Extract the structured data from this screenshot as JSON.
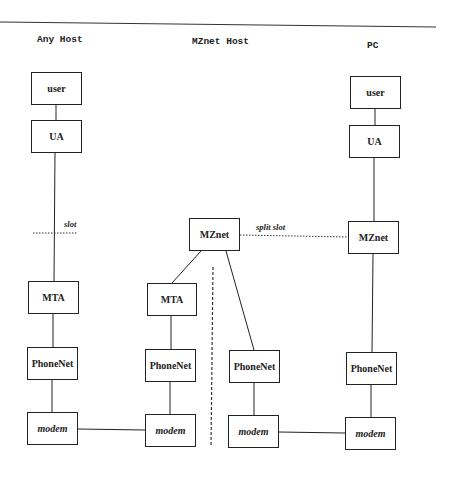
{
  "diagram": {
    "columns": [
      {
        "id": "any-host",
        "title": "Any Host"
      },
      {
        "id": "mznet-host",
        "title": "MZnet Host"
      },
      {
        "id": "pc",
        "title": "PC"
      }
    ],
    "nodes": {
      "any_user": "user",
      "any_ua": "UA",
      "any_mta": "MTA",
      "any_phonenet": "PhoneNet",
      "any_modem": "modem",
      "mz_mznet": "MZnet",
      "mz_mta": "MTA",
      "mz_phonenet_left": "PhoneNet",
      "mz_modem_left": "modem",
      "mz_phonenet_right": "PhoneNet",
      "mz_modem_right": "modem",
      "pc_user": "user",
      "pc_ua": "UA",
      "pc_mznet": "MZnet",
      "pc_phonenet": "PhoneNet",
      "pc_modem": "modem"
    },
    "labels": {
      "slot": "slot",
      "split_slot": "split slot"
    },
    "edges": [
      [
        "any_user",
        "any_ua"
      ],
      [
        "any_ua",
        "any_mta"
      ],
      [
        "any_mta",
        "any_phonenet"
      ],
      [
        "any_phonenet",
        "any_modem"
      ],
      [
        "any_modem",
        "mz_modem_left"
      ],
      [
        "mz_mznet",
        "mz_mta"
      ],
      [
        "mz_mznet",
        "mz_phonenet_right"
      ],
      [
        "mz_mta",
        "mz_phonenet_left"
      ],
      [
        "mz_phonenet_left",
        "mz_modem_left"
      ],
      [
        "mz_phonenet_right",
        "mz_modem_right"
      ],
      [
        "mz_modem_right",
        "pc_modem"
      ],
      [
        "pc_user",
        "pc_ua"
      ],
      [
        "pc_ua",
        "pc_mznet"
      ],
      [
        "pc_mznet",
        "pc_phonenet"
      ],
      [
        "pc_phonenet",
        "pc_modem"
      ]
    ],
    "dotted_links": [
      {
        "label": "slot",
        "between": "any_ua-any_mta"
      },
      {
        "label": "split slot",
        "between": "mz_mznet-pc_mznet"
      }
    ],
    "separator": "dashed vertical line inside MZnet Host"
  }
}
